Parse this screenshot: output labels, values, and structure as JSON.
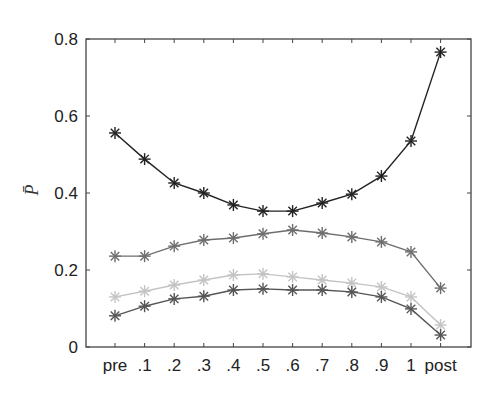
{
  "chart_data": {
    "type": "line",
    "title": "",
    "xlabel": "",
    "ylabel": "P̄",
    "categories": [
      "pre",
      ".1",
      ".2",
      ".3",
      ".4",
      ".5",
      ".6",
      ".7",
      ".8",
      ".9",
      "1",
      "post"
    ],
    "ylim": [
      0,
      0.8
    ],
    "yticks": [
      0,
      0.2,
      0.4,
      0.6,
      0.8
    ],
    "ytick_labels": [
      "0",
      "0.2",
      "0.4",
      "0.6",
      "0.8"
    ],
    "grid": false,
    "legend": null,
    "marker": "asterisk",
    "series": [
      {
        "name": "series-1",
        "color": "#222222",
        "values": [
          0.556,
          0.488,
          0.426,
          0.4,
          0.369,
          0.353,
          0.353,
          0.374,
          0.397,
          0.444,
          0.535,
          0.766
        ]
      },
      {
        "name": "series-2",
        "color": "#6e6e6e",
        "values": [
          0.236,
          0.236,
          0.262,
          0.278,
          0.283,
          0.294,
          0.304,
          0.296,
          0.286,
          0.273,
          0.247,
          0.153
        ]
      },
      {
        "name": "series-3",
        "color": "#c4c4c4",
        "values": [
          0.13,
          0.145,
          0.161,
          0.174,
          0.187,
          0.19,
          0.182,
          0.174,
          0.166,
          0.156,
          0.13,
          0.057
        ]
      },
      {
        "name": "series-4",
        "color": "#555555",
        "values": [
          0.081,
          0.106,
          0.125,
          0.132,
          0.148,
          0.151,
          0.148,
          0.148,
          0.143,
          0.13,
          0.099,
          0.031
        ]
      }
    ]
  }
}
